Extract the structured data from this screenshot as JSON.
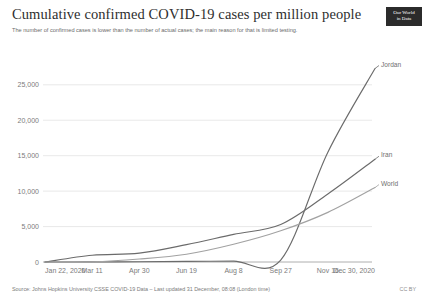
{
  "header": {
    "title": "Cumulative confirmed COVID-19 cases per million people",
    "subtitle": "The number of confirmed cases is lower than the number of actual cases; the main reason for that is limited testing."
  },
  "logo": {
    "line1": "Our World",
    "line2": "in Data"
  },
  "footer": {
    "source": "Source: Johns Hopkins University CSSE COVID-19 Data – Last updated 31 December, 08:08 (London time)",
    "license": "CC BY"
  },
  "chart_data": {
    "type": "line",
    "title": "Cumulative confirmed COVID-19 cases per million people",
    "subtitle": "The number of confirmed cases is lower than the number of actual cases; the main reason for that is limited testing.",
    "xlabel": "",
    "ylabel": "",
    "grid": "horizontal",
    "legend_position": "right-of-line-ends",
    "xtick_labels": [
      "Jan 22, 2020",
      "Mar 11",
      "Apr 30",
      "Jun 19",
      "Aug 8",
      "Sep 27",
      "Nov 16",
      "Dec 30, 2020"
    ],
    "ytick_labels": [
      "0",
      "5,000",
      "10,000",
      "15,000",
      "20,000",
      "25,000"
    ],
    "ytick_values": [
      0,
      5000,
      10000,
      15000,
      20000,
      25000
    ],
    "ylim": [
      0,
      28500
    ],
    "xlim": [
      "2020-01-22",
      "2020-12-30"
    ],
    "x": [
      "Jan 22, 2020",
      "Mar 11",
      "Apr 30",
      "Jun 19",
      "Aug 8",
      "Sep 27",
      "Nov 16",
      "Dec 30, 2020"
    ],
    "series": [
      {
        "name": "Jordan",
        "color": "#6b6b6b",
        "label": "Jordan",
        "end_value": 27300,
        "values": [
          0,
          10,
          40,
          90,
          130,
          280,
          15500,
          27300
        ]
      },
      {
        "name": "Iran",
        "color": "#6b6b6b",
        "label": "Iran",
        "end_value": 14500,
        "values": [
          0,
          950,
          1250,
          2450,
          3900,
          5300,
          9600,
          14500
        ]
      },
      {
        "name": "World",
        "color": "#a2a2a2",
        "label": "World",
        "end_value": 10500,
        "values": [
          0,
          20,
          420,
          1100,
          2500,
          4400,
          7000,
          10500
        ]
      }
    ]
  }
}
